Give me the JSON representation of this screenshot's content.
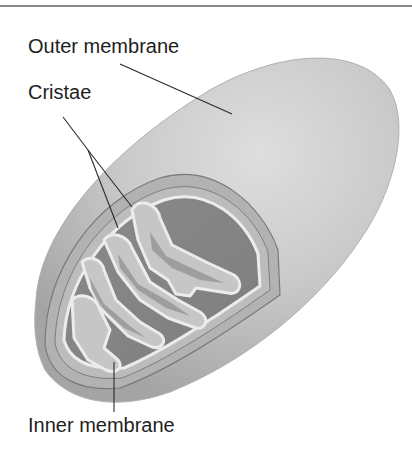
{
  "figure": {
    "labels": {
      "outer_membrane": "Outer membrane",
      "cristae": "Cristae",
      "inner_membrane": "Inner membrane"
    },
    "colors": {
      "background": "#ffffff",
      "outer_surface_light": "#d6d6d6",
      "outer_surface_dark": "#a8a8a8",
      "intermembrane_space": "#b4b4b4",
      "membrane_edge": "#7a7a7a",
      "inner_membrane_light": "#eaeaea",
      "matrix": "#8c8c8c",
      "matrix_dark": "#7c7c7c",
      "crista_fold": "#c4c4c4",
      "leader_line": "#2a2a2a",
      "label_text": "#1e1e1e",
      "top_rule": "#8c8c8c"
    }
  }
}
